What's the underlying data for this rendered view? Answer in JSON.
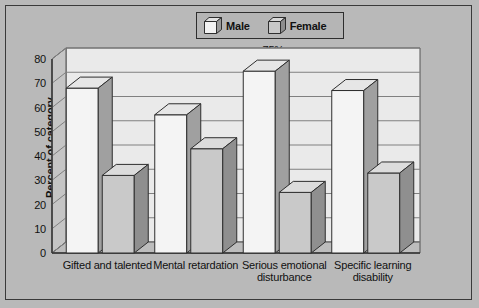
{
  "figure": {
    "background_color": "#b9b9b9",
    "frame_color": "#3a3a3a"
  },
  "legend": {
    "position": "top-center",
    "entries": [
      {
        "label": "Male",
        "swatch": "cube-icon-male",
        "face_color": "#f2f2f2",
        "side_color": "#9a9a9a",
        "top_color": "#dcdcdc"
      },
      {
        "label": "Female",
        "swatch": "cube-icon-female",
        "face_color": "#c8c8c8",
        "side_color": "#8d8d8d",
        "top_color": "#d8d8d8"
      }
    ]
  },
  "axes": {
    "y_title": "Percent of category",
    "y_ticks": [
      "0",
      "10",
      "20",
      "30",
      "40",
      "50",
      "60",
      "70",
      "80"
    ],
    "x_categories": [
      "Gifted and talented",
      "Mental retardation",
      "Serious emotional\ndisturbance",
      "Specific learning\ndisability"
    ]
  },
  "chart_data": {
    "type": "bar",
    "title": "",
    "subtitle": "",
    "xlabel": "",
    "ylabel": "Percent of category",
    "ylim": [
      0,
      80
    ],
    "ytick_step": 10,
    "grid": true,
    "legend_position": "top-center",
    "style": "3d-column",
    "categories": [
      "Gifted and talented",
      "Mental retardation",
      "Serious emotional disturbance",
      "Specific learning disability"
    ],
    "series": [
      {
        "name": "Male",
        "values": [
          68,
          57,
          75,
          67
        ],
        "labels": [
          "68%",
          "57%",
          "75%",
          "67%"
        ]
      },
      {
        "name": "Female",
        "values": [
          32,
          43,
          25,
          33
        ],
        "labels": [
          "32%",
          "43%",
          "25%",
          "33%"
        ]
      }
    ],
    "data_labels": [
      "68%",
      "32%",
      "57%",
      "43%",
      "75%",
      "25%",
      "67%",
      "33%"
    ],
    "annotations": []
  }
}
